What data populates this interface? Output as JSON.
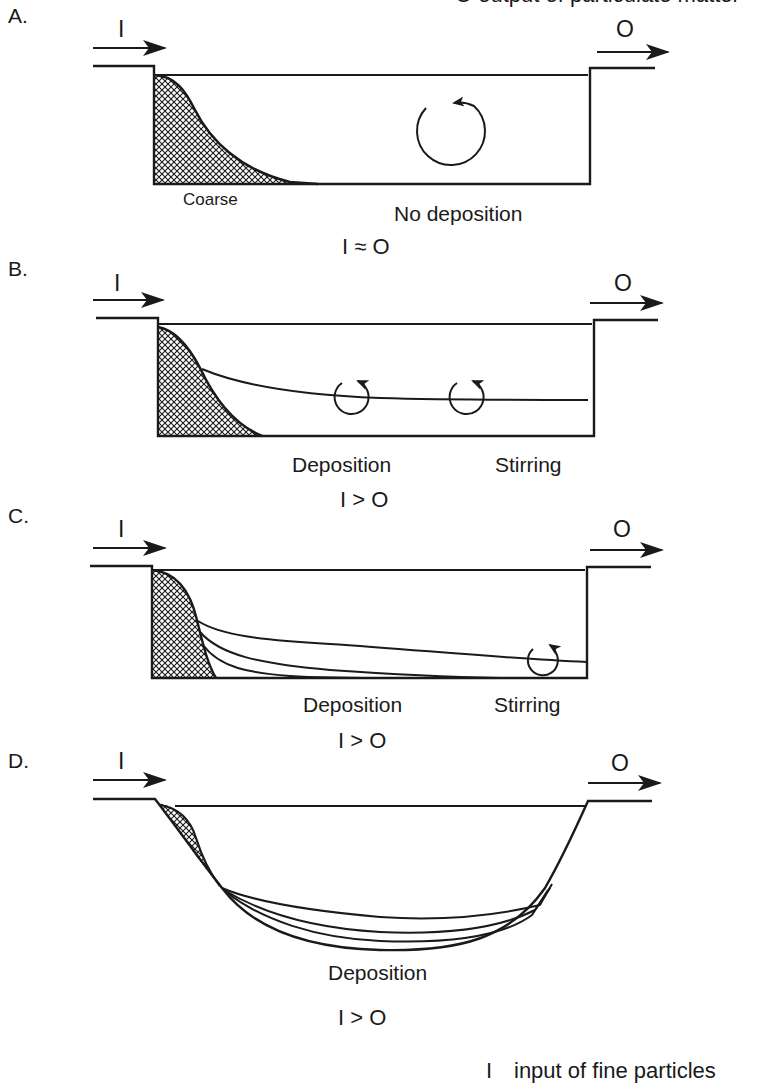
{
  "figure": {
    "top_cut_text": "O output of particulate matter",
    "legend": {
      "symbol": "I",
      "text": "input of fine particles"
    }
  },
  "panels": [
    {
      "letter": "A.",
      "input_symbol": "I",
      "output_symbol": "O",
      "labels": {
        "coarse": "Coarse",
        "status": "No deposition"
      },
      "relation": "I ≈ O"
    },
    {
      "letter": "B.",
      "input_symbol": "I",
      "output_symbol": "O",
      "labels": {
        "deposition": "Deposition",
        "stirring": "Stirring"
      },
      "relation": "I > O"
    },
    {
      "letter": "C.",
      "input_symbol": "I",
      "output_symbol": "O",
      "labels": {
        "deposition": "Deposition",
        "stirring": "Stirring"
      },
      "relation": "I > O"
    },
    {
      "letter": "D.",
      "input_symbol": "I",
      "output_symbol": "O",
      "labels": {
        "deposition": "Deposition"
      },
      "relation": "I > O"
    }
  ],
  "colors": {
    "ink": "#1a1a1a",
    "background": "#ffffff"
  }
}
